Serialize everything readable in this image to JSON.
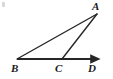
{
  "figure": {
    "type": "geometry-diagram",
    "background_color": "#ffffff",
    "stroke_color": "#262626",
    "labels": [
      {
        "id": "A",
        "text": "A",
        "x": 97,
        "y": 14
      },
      {
        "id": "B",
        "text": "B",
        "x": 17,
        "y": 59
      },
      {
        "id": "C",
        "text": "C",
        "x": 62,
        "y": 59
      },
      {
        "id": "D",
        "text": "D",
        "x": 95,
        "y": 59
      }
    ],
    "points": {
      "A": {
        "x": 97,
        "y": 14
      },
      "B": {
        "x": 17,
        "y": 59
      },
      "C": {
        "x": 62,
        "y": 59
      },
      "D": {
        "x": 95,
        "y": 59
      }
    },
    "segments": [
      {
        "name": "segment-BA",
        "from": "B",
        "to": "A",
        "x1": 17,
        "y1": 59,
        "x2": 97,
        "y2": 14,
        "arrow": "none",
        "width": 1.4
      },
      {
        "name": "segment-CA",
        "from": "C",
        "to": "A",
        "x1": 62,
        "y1": 59,
        "x2": 97,
        "y2": 14,
        "arrow": "none",
        "width": 1.4
      },
      {
        "name": "ray-BD",
        "from": "B",
        "to": "D",
        "x1": 17,
        "y1": 59,
        "x2": 92,
        "y2": 59,
        "arrow": "end",
        "width": 2.0
      }
    ],
    "artifact": {
      "name": "scan-artifact",
      "x": 2,
      "y": 2
    }
  }
}
